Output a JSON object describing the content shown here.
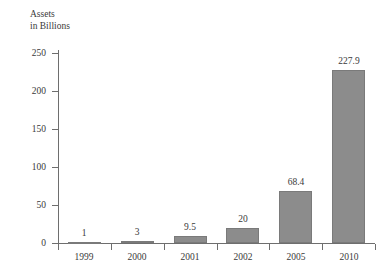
{
  "chart_data": {
    "type": "bar",
    "title": "",
    "subtitle": "",
    "xlabel": "",
    "ylabel": "Assets in Billions",
    "ylabel_lines": [
      "Assets",
      "in Billions"
    ],
    "categories": [
      "1999",
      "2000",
      "2001",
      "2002",
      "2005",
      "2010"
    ],
    "values": [
      1,
      3,
      9.5,
      20,
      68.4,
      227.9
    ],
    "data_labels": [
      "1",
      "3",
      "9.5",
      "20",
      "68.4",
      "227.9"
    ],
    "ylim": [
      0,
      250
    ],
    "y_ticks": [
      250,
      200,
      150,
      100,
      50,
      0
    ],
    "y_tick_labels": [
      "250",
      "200",
      "150",
      "100",
      "50",
      "0"
    ],
    "grid": false,
    "legend": false,
    "legend_position": "none",
    "bar_color": "#8c8c8c",
    "bar_edge_color": "#7a7a7a",
    "axis_color": "#6e6e6e",
    "text_color": "#3a3a3a",
    "background_color": "#ffffff"
  }
}
